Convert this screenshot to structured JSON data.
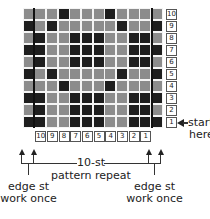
{
  "chart": {
    "columns": 12,
    "rows": 10,
    "colors": {
      "light": "#8c8c8c",
      "dark": "#1e1e1e",
      "grid": "#f4f4f4"
    },
    "pattern_rows_top_to_bottom": [
      {
        "row": 10,
        "cells": "LLLDLLLDLLLL"
      },
      {
        "row": 9,
        "cells": "DLDLLLLLDLLD"
      },
      {
        "row": 8,
        "cells": "LDLLDDDLLDDL"
      },
      {
        "row": 7,
        "cells": "DDLLDDDLLDDD"
      },
      {
        "row": 6,
        "cells": "LDLLDDDLLDDL"
      },
      {
        "row": 5,
        "cells": "DLDLLLLLDLLD"
      },
      {
        "row": 4,
        "cells": "LLLDLLLDLLLL"
      },
      {
        "row": 3,
        "cells": "DDLLDDDLLDDD"
      },
      {
        "row": 2,
        "cells": "LDLLDDDLLDDL"
      },
      {
        "row": 1,
        "cells": "DDLLDDDLLDDD"
      }
    ],
    "row_numbers": [
      "10",
      "9",
      "8",
      "7",
      "6",
      "5",
      "4",
      "3",
      "2",
      "1"
    ],
    "column_numbers": [
      "10",
      "9",
      "8",
      "7",
      "6",
      "5",
      "4",
      "3",
      "2",
      "1"
    ]
  },
  "labels": {
    "start": "start",
    "here": "here",
    "repeat_line1": "10-st",
    "repeat_line2": "pattern repeat",
    "left_edge_line1": "edge st",
    "left_edge_line2": "work once",
    "right_edge_line1": "edge st",
    "right_edge_line2": "work once"
  }
}
